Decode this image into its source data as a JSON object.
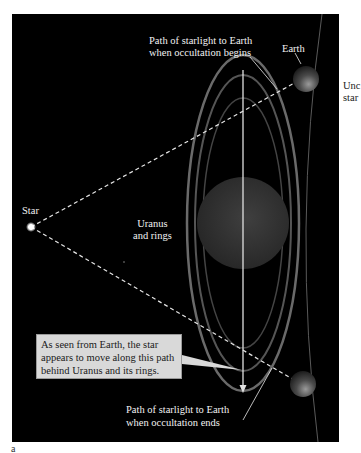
{
  "figure": {
    "panel_label": "a",
    "background": "#000000",
    "labels": {
      "path_begin": [
        "Path of starlight to Earth",
        "when occultation begins"
      ],
      "earth": "Earth",
      "star": "Star",
      "uranus": [
        "Uranus",
        "and rings"
      ],
      "path_end": [
        "Path of starlight to Earth",
        "when occultation ends"
      ],
      "cutoff_right": [
        "Unc",
        "star"
      ]
    },
    "callout": {
      "lines": [
        "As seen from Earth, the star",
        "appears to move along this path",
        "behind Uranus and its rings."
      ],
      "fill": "#d9d9d9"
    },
    "objects": {
      "star": {
        "x": 31,
        "y": 227
      },
      "earth_top": {
        "x": 306,
        "y": 79,
        "r": 13
      },
      "earth_bottom": {
        "x": 303,
        "y": 384,
        "r": 13
      },
      "uranus": {
        "x": 243,
        "y": 223,
        "r": 46
      }
    }
  }
}
